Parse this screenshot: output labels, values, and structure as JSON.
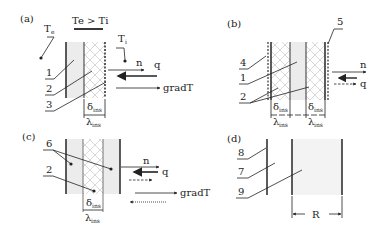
{
  "panels": {
    "a": {
      "tag": "(a)",
      "condition": "Te > Ti",
      "te": "T",
      "te_sub": "e",
      "ti": "T",
      "ti_sub": "i",
      "labels": [
        "1",
        "2",
        "3"
      ],
      "n": "n",
      "q": "q",
      "grad": "gradT",
      "delta": "δ",
      "lambda": "λ",
      "ins": "ins"
    },
    "b": {
      "tag": "(b)",
      "labels": [
        "4",
        "1",
        "2",
        "5"
      ],
      "n": "n",
      "q": "q",
      "delta": "δ",
      "lambda": "λ",
      "ins": "ins"
    },
    "c": {
      "tag": "(c)",
      "labels": [
        "6",
        "2"
      ],
      "n": "n",
      "q": "q",
      "grad": "gradT",
      "delta": "δ",
      "lambda": "λ",
      "ins": "ins"
    },
    "d": {
      "tag": "(d)",
      "labels": [
        "8",
        "7",
        "9"
      ],
      "r": "R"
    }
  }
}
